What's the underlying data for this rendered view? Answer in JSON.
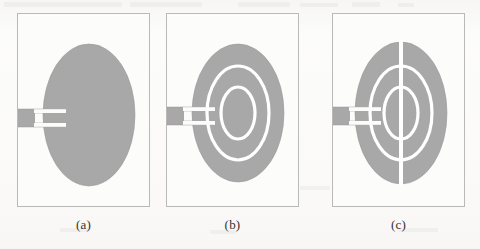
{
  "figure": {
    "type": "line-art-diagram",
    "background_color": "#fbfbfa",
    "patch_color": "#a8a8a8",
    "patch_edge_color": "#9a9a9a",
    "slot_color": "#ffffff",
    "panel_border_color": "#b9b9b7",
    "caption_color": "#35332f"
  },
  "panels": [
    {
      "id": "panel-a",
      "caption": "(a)",
      "description": "plain elliptical patch with inset microstrip feed",
      "frame": {
        "x": 17,
        "y": 13,
        "w": 133,
        "h": 194
      },
      "patch": {
        "cx": 88,
        "cy": 114,
        "rx": 46,
        "ry": 71
      },
      "feed": {
        "x": 0,
        "y": 108,
        "w": 46,
        "h": 12
      },
      "inset_notch": {
        "w": 30,
        "h": 4,
        "gap": 12
      },
      "ring_slots": [],
      "vertical_slot": false
    },
    {
      "id": "panel-b",
      "caption": "(b)",
      "description": "elliptical patch with two concentric elliptical ring slots",
      "frame": {
        "x": 166,
        "y": 13,
        "w": 133,
        "h": 194
      },
      "patch": {
        "cx": 237,
        "cy": 112,
        "rx": 46,
        "ry": 69
      },
      "feed": {
        "x": 0,
        "y": 106,
        "w": 46,
        "h": 12
      },
      "inset_notch": {
        "w": 30,
        "h": 4,
        "gap": 12
      },
      "ring_slots": [
        {
          "rx": 31,
          "ry": 47,
          "stroke": 3
        },
        {
          "rx": 17,
          "ry": 26,
          "stroke": 3
        }
      ],
      "vertical_slot": false
    },
    {
      "id": "panel-c",
      "caption": "(c)",
      "description": "elliptical patch with two ring slots and a full vertical slot",
      "frame": {
        "x": 332,
        "y": 13,
        "w": 133,
        "h": 194
      },
      "patch": {
        "cx": 400,
        "cy": 112,
        "rx": 46,
        "ry": 71
      },
      "feed": {
        "x": 0,
        "y": 106,
        "w": 46,
        "h": 12
      },
      "inset_notch": {
        "w": 30,
        "h": 4,
        "gap": 12
      },
      "ring_slots": [
        {
          "rx": 31,
          "ry": 47,
          "stroke": 3
        },
        {
          "rx": 17,
          "ry": 26,
          "stroke": 3
        }
      ],
      "vertical_slot": true,
      "vertical_slot_width": 4
    }
  ],
  "captions": {
    "a": "(a)",
    "b": "(b)",
    "c": "(c)"
  }
}
